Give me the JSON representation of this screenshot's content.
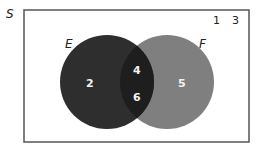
{
  "diagram": {
    "type": "venn",
    "universe": {
      "label": "S",
      "outside_elements": [
        "1",
        "3"
      ]
    },
    "sets": [
      {
        "label": "E",
        "color": "#2e2e2e",
        "only_elements": [
          "2"
        ]
      },
      {
        "label": "F",
        "color": "#7f7f7f",
        "only_elements": [
          "5"
        ]
      }
    ],
    "intersection": {
      "color": "#1e1e1e",
      "elements": [
        "4",
        "6"
      ]
    },
    "colors": {
      "background": "#ffffff",
      "border": "#555555",
      "text_dark": "#222222",
      "text_light": "#f2f2f2"
    }
  }
}
